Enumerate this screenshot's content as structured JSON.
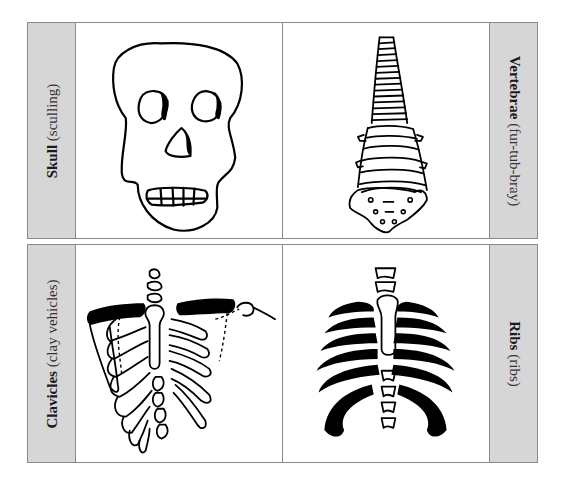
{
  "cards": [
    {
      "position": "top",
      "left_cell": {
        "illustration": "skull"
      },
      "right_cell": {
        "illustration": "vertebrae"
      },
      "left_label": {
        "term": "Skull",
        "pronunciation": "(sculling)"
      },
      "right_label": {
        "term": "Vertebrae",
        "pronunciation": "(fur-tub-bray)"
      }
    },
    {
      "position": "bottom",
      "left_cell": {
        "illustration": "clavicles"
      },
      "right_cell": {
        "illustration": "ribs"
      },
      "left_label": {
        "term": "Clavicles",
        "pronunciation": "(clay vehicles)"
      },
      "right_label": {
        "term": "Ribs",
        "pronunciation": "(ribs)"
      }
    }
  ],
  "colors": {
    "label_strip": "#d6d6d6",
    "border": "#8a8a8a",
    "ink": "#000000"
  }
}
